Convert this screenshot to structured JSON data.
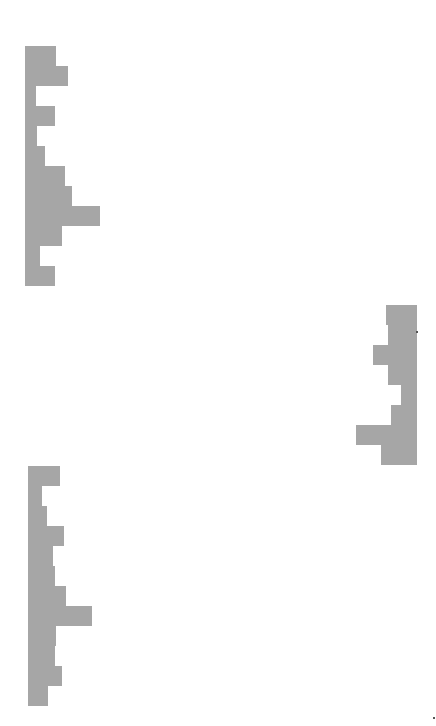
{
  "chart_data": [
    {
      "type": "bar",
      "orientation": "horizontal",
      "title": "",
      "xlabel": "",
      "ylabel": "",
      "grid": false,
      "legend": null,
      "anchor": "left",
      "origin": {
        "x": 25,
        "y": 46
      },
      "bar_height": 20,
      "color": "#a6a6a6",
      "categories": [
        "1",
        "2",
        "3",
        "4",
        "5",
        "6",
        "7",
        "8",
        "9",
        "10",
        "11",
        "12"
      ],
      "values": [
        31,
        43,
        11,
        30,
        12,
        20,
        40,
        47,
        75,
        37,
        15,
        30
      ]
    },
    {
      "type": "bar",
      "orientation": "horizontal",
      "title": "",
      "xlabel": "",
      "ylabel": "",
      "grid": false,
      "legend": null,
      "anchor": "right",
      "origin": {
        "x": 417,
        "y": 305
      },
      "bar_height": 20,
      "color": "#a6a6a6",
      "categories": [
        "1",
        "2",
        "3",
        "4",
        "5",
        "6",
        "7",
        "8"
      ],
      "values": [
        31,
        29,
        44,
        29,
        16,
        26,
        61,
        36
      ]
    },
    {
      "type": "bar",
      "orientation": "horizontal",
      "title": "",
      "xlabel": "",
      "ylabel": "",
      "grid": false,
      "legend": null,
      "anchor": "left",
      "origin": {
        "x": 28,
        "y": 466
      },
      "bar_height": 20,
      "color": "#a6a6a6",
      "categories": [
        "1",
        "2",
        "3",
        "4",
        "5",
        "6",
        "7",
        "8",
        "9",
        "10",
        "11",
        "12"
      ],
      "values": [
        32,
        14,
        19,
        36,
        25,
        27,
        38,
        64,
        28,
        27,
        34,
        20
      ]
    }
  ],
  "marks": [
    {
      "x": 416,
      "y": 331
    },
    {
      "x": 433,
      "y": 717
    }
  ]
}
